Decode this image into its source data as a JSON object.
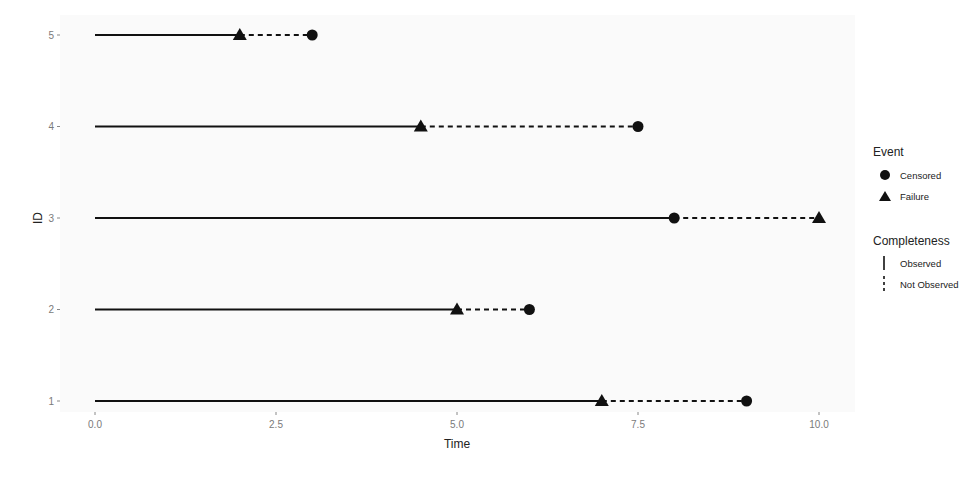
{
  "chart_data": {
    "type": "line",
    "subtype": "survival-segment-plot",
    "title": "",
    "xlabel": "Time",
    "ylabel": "ID",
    "xlim": [
      0,
      10
    ],
    "ylim": [
      1,
      5
    ],
    "x_ticks": [
      0.0,
      2.5,
      5.0,
      7.5,
      10.0
    ],
    "x_tick_labels": [
      "0.0",
      "2.5",
      "5.0",
      "7.5",
      "10.0"
    ],
    "y_ticks": [
      1,
      2,
      3,
      4,
      5
    ],
    "y_tick_labels": [
      "1",
      "2",
      "3",
      "4",
      "5"
    ],
    "grid": false,
    "legend_position": "right",
    "subjects": [
      {
        "id": 1,
        "observed": [
          0,
          7
        ],
        "not_observed": [
          7,
          9
        ],
        "events": [
          {
            "time": 7,
            "event": "Failure"
          },
          {
            "time": 9,
            "event": "Censored"
          }
        ]
      },
      {
        "id": 2,
        "observed": [
          0,
          5
        ],
        "not_observed": [
          5,
          6
        ],
        "events": [
          {
            "time": 5,
            "event": "Failure"
          },
          {
            "time": 6,
            "event": "Censored"
          }
        ]
      },
      {
        "id": 3,
        "observed": [
          0,
          8
        ],
        "not_observed": [
          8,
          10
        ],
        "events": [
          {
            "time": 8,
            "event": "Censored"
          },
          {
            "time": 10,
            "event": "Failure"
          }
        ]
      },
      {
        "id": 4,
        "observed": [
          0,
          4.5
        ],
        "not_observed": [
          4.5,
          7.5
        ],
        "events": [
          {
            "time": 4.5,
            "event": "Failure"
          },
          {
            "time": 7.5,
            "event": "Censored"
          }
        ]
      },
      {
        "id": 5,
        "observed": [
          0,
          2
        ],
        "not_observed": [
          2,
          3
        ],
        "events": [
          {
            "time": 2,
            "event": "Failure"
          },
          {
            "time": 3,
            "event": "Censored"
          }
        ]
      }
    ],
    "legend": {
      "event": {
        "title": "Event",
        "items": [
          {
            "label": "Censored",
            "shape": "circle"
          },
          {
            "label": "Failure",
            "shape": "triangle"
          }
        ]
      },
      "completeness": {
        "title": "Completeness",
        "items": [
          {
            "label": "Observed",
            "linetype": "solid"
          },
          {
            "label": "Not Observed",
            "linetype": "dashed"
          }
        ]
      }
    }
  },
  "colors": {
    "panel_bg": "#fafafa",
    "line": "#111111",
    "tick_text": "#7a7a7a",
    "text": "#222222"
  }
}
